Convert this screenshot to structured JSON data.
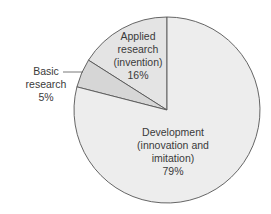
{
  "chart_data": {
    "type": "pie",
    "title": "",
    "categories": [
      "Basic research",
      "Applied research (invention)",
      "Development (innovation and imitation)"
    ],
    "values": [
      5,
      16,
      79
    ],
    "unit": "%",
    "start_angle_deg": 0,
    "direction": "clockwise-from-top",
    "slices": [
      {
        "name": "Applied research (invention)",
        "value": 16,
        "color": "#e4e4e4",
        "label_lines": [
          "Applied",
          "research",
          "(invention)",
          "16%"
        ]
      },
      {
        "name": "Development (innovation and imitation)",
        "value": 79,
        "color": "#ededed",
        "label_lines": [
          "Development",
          "(innovation and",
          "imitation)",
          "79%"
        ]
      },
      {
        "name": "Basic research",
        "value": 5,
        "color": "#d6d6d6",
        "label_lines": [
          "Basic",
          "research",
          "5%"
        ]
      }
    ],
    "legend": "none (labels on/next to slices)",
    "stroke_color": "#555555"
  },
  "labels": {
    "applied": {
      "l1": "Applied",
      "l2": "research",
      "l3": "(invention)",
      "l4": "16%"
    },
    "development": {
      "l1": "Development",
      "l2": "(innovation and",
      "l3": "imitation)",
      "l4": "79%"
    },
    "basic": {
      "l1": "Basic",
      "l2": "research",
      "l3": "5%"
    }
  }
}
